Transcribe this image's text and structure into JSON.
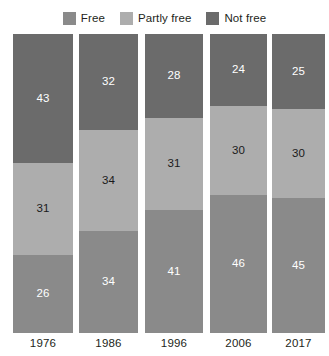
{
  "chart_data": {
    "type": "bar",
    "title": "",
    "subtitle": "",
    "xlabel": "",
    "ylabel": "",
    "ylim": [
      0,
      100
    ],
    "grid": false,
    "stacked": true,
    "orientation": "vertical",
    "legend_position": "top-center",
    "categories": [
      "1976",
      "1986",
      "1996",
      "2006",
      "2017"
    ],
    "series": [
      {
        "name": "Free",
        "color": "#8a8a8a",
        "values": [
          26,
          34,
          41,
          46,
          45
        ]
      },
      {
        "name": "Partly free",
        "color": "#adadad",
        "values": [
          31,
          34,
          31,
          30,
          30
        ]
      },
      {
        "name": "Not free",
        "color": "#6b6b6b",
        "values": [
          43,
          32,
          28,
          24,
          25
        ]
      }
    ],
    "stack_order_bottom_to_top": [
      "Free",
      "Partly free",
      "Not free"
    ],
    "bars": [
      {
        "category": "1976",
        "segments": [
          {
            "name": "Not free",
            "value": 43,
            "label": "43",
            "color": "#6b6b6b",
            "text_color": "#ffffff"
          },
          {
            "name": "Partly free",
            "value": 31,
            "label": "31",
            "color": "#adadad",
            "text_color": "#1a1a1a"
          },
          {
            "name": "Free",
            "value": 26,
            "label": "26",
            "color": "#8a8a8a",
            "text_color": "#ffffff"
          }
        ]
      },
      {
        "category": "1986",
        "segments": [
          {
            "name": "Not free",
            "value": 32,
            "label": "32",
            "color": "#6b6b6b",
            "text_color": "#ffffff"
          },
          {
            "name": "Partly free",
            "value": 34,
            "label": "34",
            "color": "#adadad",
            "text_color": "#1a1a1a"
          },
          {
            "name": "Free",
            "value": 34,
            "label": "34",
            "color": "#8a8a8a",
            "text_color": "#ffffff"
          }
        ]
      },
      {
        "category": "1996",
        "segments": [
          {
            "name": "Not free",
            "value": 28,
            "label": "28",
            "color": "#6b6b6b",
            "text_color": "#ffffff"
          },
          {
            "name": "Partly free",
            "value": 31,
            "label": "31",
            "color": "#adadad",
            "text_color": "#1a1a1a"
          },
          {
            "name": "Free",
            "value": 41,
            "label": "41",
            "color": "#8a8a8a",
            "text_color": "#ffffff"
          }
        ]
      },
      {
        "category": "2006",
        "segments": [
          {
            "name": "Not free",
            "value": 24,
            "label": "24",
            "color": "#6b6b6b",
            "text_color": "#ffffff"
          },
          {
            "name": "Partly free",
            "value": 30,
            "label": "30",
            "color": "#adadad",
            "text_color": "#1a1a1a"
          },
          {
            "name": "Free",
            "value": 46,
            "label": "46",
            "color": "#8a8a8a",
            "text_color": "#ffffff"
          }
        ]
      },
      {
        "category": "2017",
        "segments": [
          {
            "name": "Not free",
            "value": 25,
            "label": "25",
            "color": "#6b6b6b",
            "text_color": "#ffffff"
          },
          {
            "name": "Partly free",
            "value": 30,
            "label": "30",
            "color": "#adadad",
            "text_color": "#1a1a1a"
          },
          {
            "name": "Free",
            "value": 45,
            "label": "45",
            "color": "#8a8a8a",
            "text_color": "#ffffff"
          }
        ]
      }
    ]
  },
  "legend": {
    "items": [
      {
        "label": "Free",
        "color": "#8a8a8a"
      },
      {
        "label": "Partly free",
        "color": "#adadad"
      },
      {
        "label": "Not free",
        "color": "#6b6b6b"
      }
    ]
  },
  "layout": {
    "bar_left_positions": [
      13,
      79,
      145,
      210,
      272
    ],
    "bar_widths": [
      60,
      59,
      58,
      57,
      53
    ],
    "plot_top": 34,
    "plot_height": 299,
    "background": "#ffffff"
  }
}
